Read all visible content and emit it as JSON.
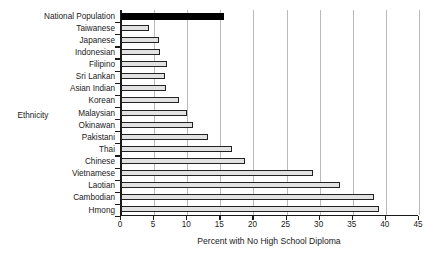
{
  "chart_data": {
    "type": "bar",
    "orientation": "horizontal",
    "title": "",
    "xlabel": "Percent with No High School Diploma",
    "ylabel": "Ethnicity",
    "xlim": [
      0,
      45
    ],
    "ylim": null,
    "grid": true,
    "legend": null,
    "xticks": [
      0,
      5,
      10,
      15,
      20,
      25,
      30,
      35,
      40,
      45
    ],
    "categories": [
      "National Population",
      "Taiwanese",
      "Japanese",
      "Indonesian",
      "Filipino",
      "Sri Lankan",
      "Asian Indian",
      "Korean",
      "Malaysian",
      "Okinawan",
      "Pakistani",
      "Thai",
      "Chinese",
      "Vietnamese",
      "Laotian",
      "Cambodian",
      "Hmong"
    ],
    "values": [
      15.5,
      4.3,
      5.8,
      5.9,
      7.0,
      6.6,
      6.8,
      8.8,
      9.9,
      10.8,
      13.2,
      16.8,
      18.8,
      29.0,
      33.0,
      38.2,
      39.0
    ],
    "highlighted_category": "National Population",
    "colors": {
      "bar_fill": "#e2e2e2",
      "bar_border": "#222222",
      "highlight_fill": "#000000",
      "gridline": "#b9b9b9",
      "axis": "#1a1a1a",
      "background": "#ffffff"
    }
  }
}
